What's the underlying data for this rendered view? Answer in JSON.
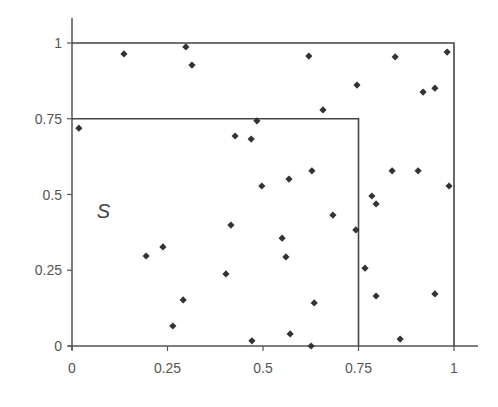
{
  "chart_data": {
    "type": "scatter",
    "title": "",
    "xlabel": "",
    "ylabel": "",
    "xlim": [
      0,
      1
    ],
    "ylim": [
      0,
      1
    ],
    "grid": false,
    "legend": null,
    "x_ticks": [
      0,
      0.25,
      0.5,
      0.75,
      1
    ],
    "x_tick_labels": [
      "0",
      "0.25",
      "0.5",
      "0.75",
      "1"
    ],
    "y_ticks": [
      0,
      0.25,
      0.5,
      0.75,
      1
    ],
    "y_tick_labels": [
      "0",
      "0.25",
      "0.5",
      "0.75",
      "1"
    ],
    "annotations": [
      {
        "text": "S",
        "x": 0.07,
        "y": 0.44,
        "style": "italic"
      }
    ],
    "regions": [
      {
        "name": "outer-square",
        "x": [
          0,
          1
        ],
        "y": [
          0,
          1
        ]
      },
      {
        "name": "inner-square-S",
        "x": [
          0,
          0.75
        ],
        "y": [
          0,
          0.75
        ]
      }
    ],
    "series": [
      {
        "name": "points",
        "marker": "diamond",
        "color": "#333333",
        "points": [
          [
            0.018,
            0.719
          ],
          [
            0.136,
            0.964
          ],
          [
            0.298,
            0.987
          ],
          [
            0.314,
            0.927
          ],
          [
            0.62,
            0.957
          ],
          [
            0.846,
            0.954
          ],
          [
            0.982,
            0.97
          ],
          [
            0.746,
            0.861
          ],
          [
            0.657,
            0.779
          ],
          [
            0.919,
            0.838
          ],
          [
            0.95,
            0.851
          ],
          [
            0.484,
            0.743
          ],
          [
            0.427,
            0.693
          ],
          [
            0.469,
            0.683
          ],
          [
            0.497,
            0.528
          ],
          [
            0.568,
            0.551
          ],
          [
            0.628,
            0.578
          ],
          [
            0.838,
            0.578
          ],
          [
            0.906,
            0.578
          ],
          [
            0.987,
            0.528
          ],
          [
            0.785,
            0.495
          ],
          [
            0.796,
            0.469
          ],
          [
            0.683,
            0.432
          ],
          [
            0.743,
            0.383
          ],
          [
            0.416,
            0.399
          ],
          [
            0.194,
            0.297
          ],
          [
            0.238,
            0.327
          ],
          [
            0.55,
            0.356
          ],
          [
            0.56,
            0.294
          ],
          [
            0.767,
            0.257
          ],
          [
            0.403,
            0.238
          ],
          [
            0.634,
            0.142
          ],
          [
            0.796,
            0.165
          ],
          [
            0.95,
            0.172
          ],
          [
            0.291,
            0.152
          ],
          [
            0.264,
            0.066
          ],
          [
            0.571,
            0.04
          ],
          [
            0.471,
            0.017
          ],
          [
            0.626,
            0.0
          ],
          [
            0.859,
            0.023
          ]
        ]
      }
    ]
  },
  "colors": {
    "axis": "#555555",
    "box": "#444444",
    "text": "#555555",
    "marker": "#333333"
  }
}
